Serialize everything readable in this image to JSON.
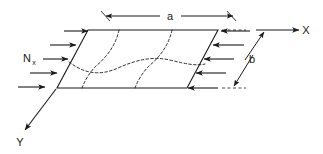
{
  "figure": {
    "type": "engineering-schematic",
    "background_color": "#ffffff",
    "line_color": "#1a1a1a"
  },
  "labels": {
    "length_dimension": "a",
    "width_dimension": "b",
    "load_symbol": "N",
    "load_subscript": "x",
    "axis_x": "X",
    "axis_y": "Y"
  },
  "geometry": {
    "plate_corners": {
      "top_left": [
        88,
        30
      ],
      "top_right": [
        218,
        30
      ],
      "bottom_right": [
        187,
        88
      ],
      "bottom_left": [
        57,
        88
      ]
    }
  },
  "load_arrows": {
    "left_count": 5,
    "right_count": 5,
    "left_direction": "right",
    "right_direction": "left"
  },
  "mode_shape": {
    "description": "dashed buckling nodal lines",
    "nodal_line_count": 2,
    "centerline_wave": true
  }
}
